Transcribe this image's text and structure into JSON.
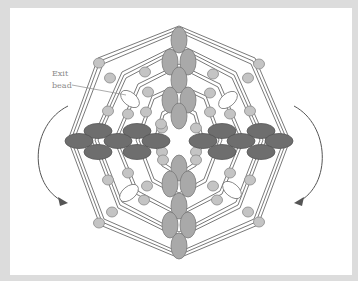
{
  "diagram": {
    "type": "beadwork-stitch-diagram",
    "label": {
      "line1": "Exit",
      "line2": "bead"
    },
    "colors": {
      "frame": "#dcdcdc",
      "background": "#ffffff",
      "thread": "#6a6a6a",
      "small_bead": "#c4c4c4",
      "column_bead": "#a9a9a9",
      "row_bead": "#6e6e6e",
      "exit_bead": "#ffffff",
      "arrow": "#555555"
    },
    "arrows": [
      {
        "name": "left-rotation-arrow",
        "direction": "down-right"
      },
      {
        "name": "right-rotation-arrow",
        "direction": "down-left"
      }
    ]
  }
}
